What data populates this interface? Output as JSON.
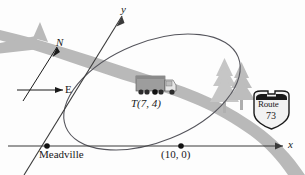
{
  "figure": {
    "background_color": "#fdfdfd",
    "road_color": "#b9b9b9",
    "tree_color": "#c3c3c3",
    "axis_color": "#3a3a3a",
    "ellipse_color": "#55555c",
    "ink_color": "#1a1a1a"
  },
  "axes": {
    "x_label": "x",
    "y_label": "y"
  },
  "compass": {
    "north_label": "N",
    "east_label": "E"
  },
  "points": [
    {
      "name": "meadville",
      "label": "Meadville"
    },
    {
      "name": "truck-position",
      "label": "T(7, 4)"
    },
    {
      "name": "x-intercept",
      "label": "(10, 0)"
    }
  ],
  "sign": {
    "top_label": "Route",
    "number_label": "73"
  },
  "objects": {
    "truck": "semi-truck",
    "trees": "pine-trees",
    "road": "highway",
    "orbit": "ellipse-path"
  }
}
